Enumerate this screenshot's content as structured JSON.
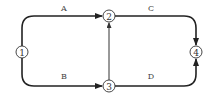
{
  "diagram": {
    "type": "network-activity-diagram",
    "nodes": [
      {
        "id": "1",
        "label": "1",
        "cx": 22,
        "cy": 52
      },
      {
        "id": "2",
        "label": "2",
        "cx": 109,
        "cy": 16
      },
      {
        "id": "3",
        "label": "3",
        "cx": 109,
        "cy": 86
      },
      {
        "id": "4",
        "label": "4",
        "cx": 196,
        "cy": 52
      }
    ],
    "edges": [
      {
        "id": "A",
        "label": "A",
        "from": "1",
        "to": "2"
      },
      {
        "id": "B",
        "label": "B",
        "from": "1",
        "to": "3"
      },
      {
        "id": "C",
        "label": "C",
        "from": "2",
        "to": "4"
      },
      {
        "id": "D",
        "label": "D",
        "from": "3",
        "to": "4"
      },
      {
        "id": "dummy",
        "label": "",
        "from": "3",
        "to": "2"
      }
    ],
    "colors": {
      "line": "#222222",
      "background": "#ffffff"
    }
  }
}
